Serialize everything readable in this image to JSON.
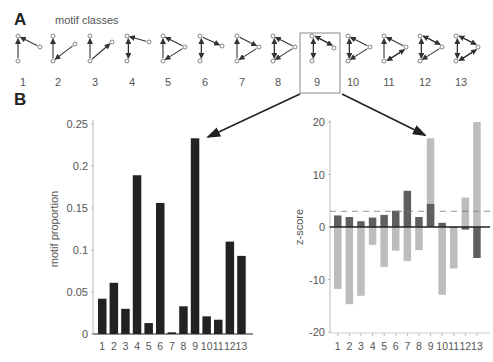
{
  "panel_a": {
    "letter": "A",
    "title": "motif classes",
    "motifs": [
      "1",
      "2",
      "3",
      "4",
      "5",
      "6",
      "7",
      "8",
      "9",
      "10",
      "11",
      "12",
      "13"
    ],
    "highlighted": "9"
  },
  "panel_b": {
    "letter": "B"
  },
  "colors": {
    "proportion_bar": "#222222",
    "z_dark": "#5f5f5f",
    "z_light": "#bdbdbd",
    "axis": "#bbbbbb",
    "zero_line": "#222222",
    "dashed": "#777777"
  },
  "chart_data": [
    {
      "type": "bar",
      "title": "",
      "xlabel": "",
      "ylabel": "motif proportion",
      "ylim": [
        0,
        0.25
      ],
      "yticks": [
        "0",
        "0.05",
        "0.1",
        "0.15",
        "0.2",
        "0.25"
      ],
      "categories": [
        "1",
        "2",
        "3",
        "4",
        "5",
        "6",
        "7",
        "8",
        "9",
        "10",
        "11",
        "12",
        "13"
      ],
      "values": [
        0.042,
        0.061,
        0.03,
        0.189,
        0.013,
        0.156,
        0.002,
        0.033,
        0.233,
        0.021,
        0.017,
        0.11,
        0.093
      ]
    },
    {
      "type": "bar",
      "title": "",
      "xlabel": "",
      "ylabel": "z-score",
      "ylim": [
        -20,
        20
      ],
      "yticks": [
        "-20",
        "-10",
        "0",
        "10",
        "20"
      ],
      "threshold_dashed": 3,
      "categories": [
        "1",
        "2",
        "3",
        "4",
        "5",
        "6",
        "7",
        "8",
        "9",
        "10",
        "11",
        "12",
        "13"
      ],
      "series": [
        {
          "name": "dark",
          "values": [
            2.2,
            1.9,
            1.1,
            1.8,
            2.3,
            3.1,
            6.9,
            1.9,
            4.4,
            0.8,
            -0.1,
            -0.5,
            -5.9
          ]
        },
        {
          "name": "light",
          "values": [
            -11.8,
            -14.7,
            -13.1,
            -3.4,
            -7.6,
            -4.5,
            -6.5,
            -4.4,
            16.9,
            -12.9,
            -7.9,
            5.6,
            20.0
          ]
        }
      ]
    }
  ]
}
